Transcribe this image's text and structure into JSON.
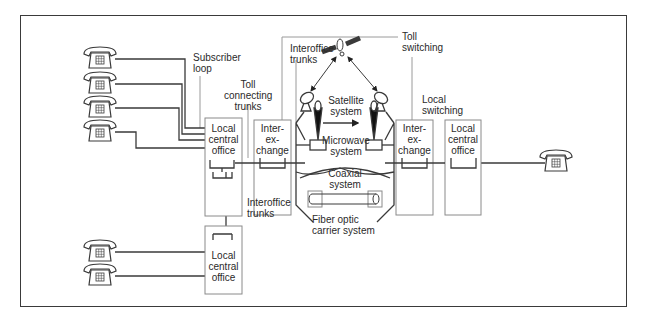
{
  "diagram": {
    "type": "telephone network overview",
    "labels": {
      "subscriber_loop": "Subscriber\nloop",
      "toll_connecting_trunks": "Toll\nconnecting\ntrunks",
      "interoffice_trunks_top": "Interoffice\ntrunks",
      "toll_switching": "Toll\nswitching",
      "local_switching": "Local\nswitching",
      "satellite_system": "Satellite\nsystem",
      "microwave_system": "Microwave\nsystem",
      "coaxial_system": "Coaxial\nsystem",
      "fiber_optic": "Fiber optic\ncarrier system",
      "interoffice_trunks_bottom": "Interoffice\ntrunks"
    },
    "nodes": {
      "local_office_left": "Local\ncentral\noffice",
      "interexchange_left": "Inter-\nex-\nchange",
      "interexchange_right": "Inter-\nex-\nchange",
      "local_office_right": "Local\ncentral\noffice",
      "local_office_bottom": "Local\ncentral\noffice"
    },
    "colors": {
      "line": "#3a3a3a",
      "box": "#8a8a8a",
      "leader": "#9a9a9a"
    }
  }
}
